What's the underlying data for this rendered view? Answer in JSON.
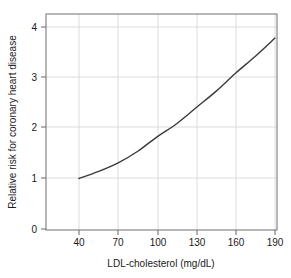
{
  "chart_data": {
    "type": "line",
    "title": "",
    "xlabel": "LDL-cholesterol (mg/dL)",
    "ylabel": "Relative risk for coronary heart disease",
    "xlim": [
      25,
      200
    ],
    "ylim": [
      0,
      4.2
    ],
    "xticks": [
      40,
      70,
      100,
      130,
      160,
      190
    ],
    "xticklabels": [
      "40",
      "70",
      "100",
      "130",
      "160",
      "190"
    ],
    "yticks": [
      0,
      1,
      2,
      3,
      4
    ],
    "yticklabels": [
      "0",
      "1",
      "2",
      "3",
      "4"
    ],
    "grid": true,
    "legend": false,
    "series": [
      {
        "name": "Relative risk",
        "x": [
          40,
          55,
          70,
          85,
          100,
          115,
          130,
          145,
          160,
          175,
          190
        ],
        "values": [
          1.0,
          1.14,
          1.31,
          1.54,
          1.83,
          2.09,
          2.41,
          2.73,
          3.09,
          3.42,
          3.78
        ]
      }
    ],
    "colors": {
      "curve": "#3a3a3a",
      "grid": "#dcdcdc",
      "frame": "#888888",
      "background": "#ffffff",
      "text": "#1a1a1a"
    }
  }
}
